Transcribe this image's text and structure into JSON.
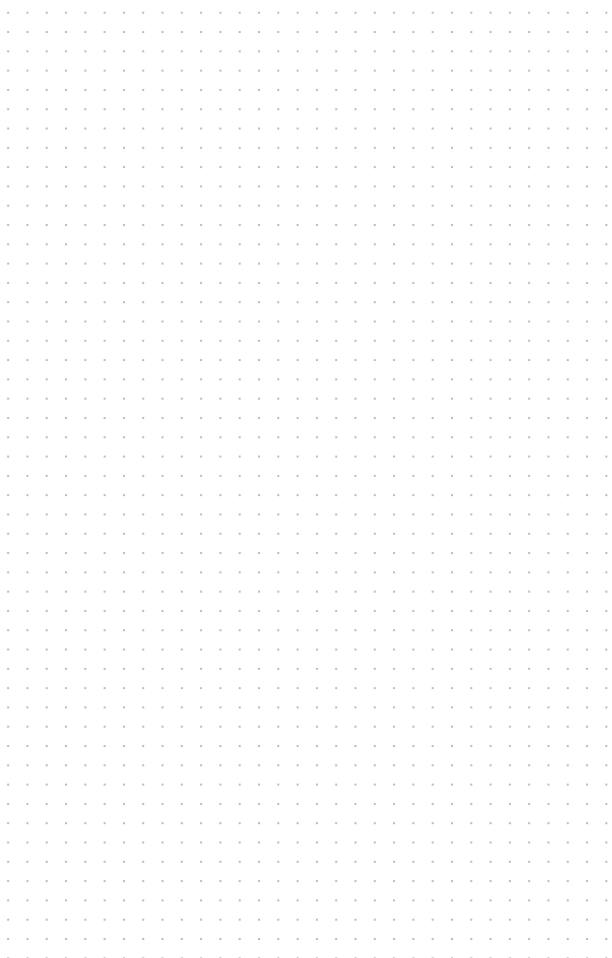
{
  "page": {
    "kind": "blank-dot-grid",
    "width_px": 612,
    "height_px": 958,
    "orientation": "portrait",
    "background_color": "#ffffff",
    "paper_tint_color": "#ffffff",
    "content_text": ""
  },
  "grid": {
    "type": "dot-grid",
    "dot_color": "#b9bac6",
    "dot_color_soft": "#e2e3ea",
    "dot_color_label": "light gray-blue",
    "dot_diameter_px": 1.6,
    "dot_core_px": "0.8px",
    "dot_radius_px": "1.6px",
    "pitch_x_px": 19.3,
    "pitch_y_px": 19.3,
    "origin_x_px": -1.5,
    "origin_y_px": 22.4,
    "first_dot_x_px": 18,
    "first_dot_y_px": 32,
    "last_dot_x_px": 576,
    "last_dot_y_px": 925,
    "columns": 31,
    "rows": 47,
    "left_edge_clipped": true,
    "repeat": "repeat"
  },
  "margins": {
    "top_px": "32px",
    "bottom_px": "33px",
    "left_px": "18px",
    "right_px": "36px"
  }
}
